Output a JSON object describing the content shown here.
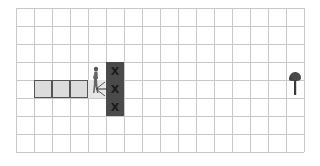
{
  "grid": {
    "cols": 16,
    "rows": 8,
    "cell_size": 18,
    "origin": [
      16,
      8
    ],
    "line_color": "#c8c8c8",
    "background": "#ffffff"
  },
  "trail": [
    {
      "col": 1,
      "row": 4,
      "style": "bordered",
      "color": "#dcdcdc"
    },
    {
      "col": 2,
      "row": 4,
      "style": "bordered",
      "color": "#dcdcdc"
    },
    {
      "col": 3,
      "row": 4,
      "style": "bordered",
      "color": "#dcdcdc"
    },
    {
      "col": 4,
      "row": 4,
      "style": "light",
      "color": "#e6e6e6"
    }
  ],
  "walls": [
    {
      "col": 5,
      "row": 3,
      "mark": "X"
    },
    {
      "col": 5,
      "row": 4,
      "mark": "X"
    },
    {
      "col": 5,
      "row": 5,
      "mark": "X"
    }
  ],
  "wall_color": "#4a4a4a",
  "agent": {
    "icon": "walking-person-icon",
    "col": 4,
    "row": 3,
    "facing": "right",
    "action_arrow": "left"
  },
  "goal": {
    "icon": "tree-icon",
    "col": 15,
    "row": 3
  }
}
